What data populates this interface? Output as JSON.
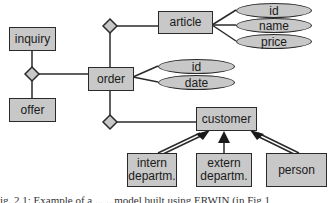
{
  "diagram": {
    "type": "entity-relationship",
    "colors": {
      "fill": "#c8c8c8",
      "stroke": "#2a2a2a",
      "background": "#ffffff"
    },
    "entities": {
      "inquiry": "inquiry",
      "offer": "offer",
      "order": "order",
      "article": "article",
      "customer": "customer",
      "intern_departm": "intern\ndepartm.",
      "extern_departm": "extern\ndepartm.",
      "person": "person"
    },
    "attributes": {
      "article": [
        "id",
        "name",
        "price"
      ],
      "order": [
        "id",
        "date"
      ]
    },
    "relationships": [
      {
        "between": [
          "inquiry",
          "offer",
          "order"
        ]
      },
      {
        "between": [
          "order",
          "article"
        ]
      },
      {
        "between": [
          "order",
          "customer"
        ]
      }
    ],
    "generalization": {
      "parent": "customer",
      "children": [
        "intern departm.",
        "extern departm.",
        "person"
      ]
    }
  },
  "caption": "ig. 2.1: Example of a ...     ...model built using ERWIN (in Fig 1"
}
